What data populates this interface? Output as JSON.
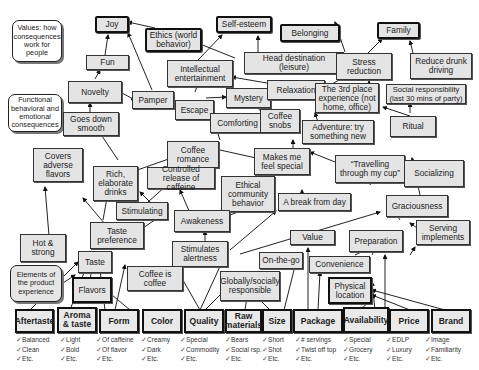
{
  "legends": {
    "values": "Values: how consequences work for people",
    "consequences": "Functional behavioral and emotional consequences",
    "attributes": "Elements of the product experience"
  },
  "values": {
    "joy": "Joy",
    "ethics": "Ethics (world behavior)",
    "self_esteem": "Self-esteem",
    "belonging": "Belonging",
    "family": "Family"
  },
  "consequences": {
    "fun": "Fun",
    "novelty": "Novelty",
    "goes_down_smooth": "Goes down smooth",
    "pamper": "Pamper",
    "intellectual_entertainment": "Intellectual entertainment",
    "head_destination": "Head destination (leisure)",
    "stress_reduction": "Stress reduction",
    "reduce_drunk_driving": "Reduce drunk driving",
    "escape": "Escape",
    "mystery": "Mystery",
    "relaxation": "Relaxation",
    "third_place": "The 3rd place experience (not home, office)",
    "social_responsibility": "Social responsibility (last 30 mins of party)",
    "comforting": "Comforting",
    "coffee_snobs": "Coffee snobs",
    "adventure": "Adventure: try something new",
    "ritual": "Ritual",
    "covers_adverse_flavors": "Covers adverse flavors",
    "rich_elaborate_drinks": "Rich, elaborate drinks",
    "coffee_romance": "Coffee romance",
    "makes_me_feel_special": "Makes me feel special",
    "travelling": "“Travelling through my cup”",
    "controlled_release": "Controlled release of caffeine",
    "ethical_community": "Ethical community behavior",
    "socializing": "Socializing",
    "stimulating": "Stimulating",
    "awakeness": "Awakeness",
    "break_from_day": "A break from day",
    "graciousness": "Graciousness",
    "taste_preference": "Taste preference",
    "hot_strong": "Hot & strong",
    "stimulates_alertness": "Stimulates alertness",
    "serving_implements": "Serving implements",
    "value": "Value",
    "preparation": "Preparation",
    "taste": "Taste",
    "on_the_go": "On-the-go",
    "convenience": "Convenience",
    "coffee_is_coffee": "Coffee is coffee",
    "globally_responsible": "Globally/socially responsible",
    "flavors": "Flavors",
    "physical_location": "Physical location"
  },
  "attributes": [
    {
      "label": "Aftertaste",
      "checks": [
        "Balanced",
        "Clean",
        "Etc."
      ]
    },
    {
      "label": "Aroma & taste",
      "checks": [
        "Light",
        "Bold",
        "Etc."
      ]
    },
    {
      "label": "Form",
      "checks": [
        "Of caffeine",
        "Of flavor",
        "Etc."
      ]
    },
    {
      "label": "Color",
      "checks": [
        "Creamy",
        "Dark",
        "Etc."
      ]
    },
    {
      "label": "Quality",
      "checks": [
        "Special",
        "Commodity",
        "Etc."
      ]
    },
    {
      "label": "Raw materials",
      "checks": [
        "Bears",
        "Social rsp.",
        "Etc."
      ]
    },
    {
      "label": "Size",
      "checks": [
        "Short",
        "Shot",
        "Etc."
      ]
    },
    {
      "label": "Package",
      "checks": [
        "# servings",
        "Twist off top",
        "Etc."
      ]
    },
    {
      "label": "Availability",
      "checks": [
        "Special",
        "Grocery",
        "Etc."
      ]
    },
    {
      "label": "Price",
      "checks": [
        "EDLP",
        "Luxury",
        "Etc."
      ]
    },
    {
      "label": "Brand",
      "checks": [
        "Image",
        "Familiarity",
        "Etc."
      ]
    }
  ],
  "colors": {
    "node_fill": "#e4e4e4",
    "border": "#222222",
    "background": "#ffffff"
  }
}
